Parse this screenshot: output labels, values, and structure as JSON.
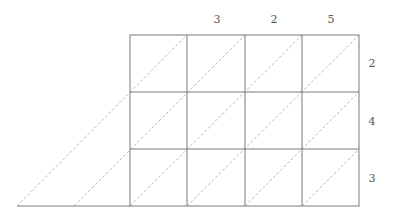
{
  "diagram": {
    "type": "lattice-multiplication",
    "top_digits": [
      "3",
      "2",
      "5"
    ],
    "right_digits": [
      "2",
      "4",
      "3"
    ],
    "grid": {
      "rows": 3,
      "cols": 3
    },
    "colors": {
      "grid_line": "#7a7a7a",
      "diagonal": "#a8a8a8",
      "label": "#555555"
    }
  }
}
